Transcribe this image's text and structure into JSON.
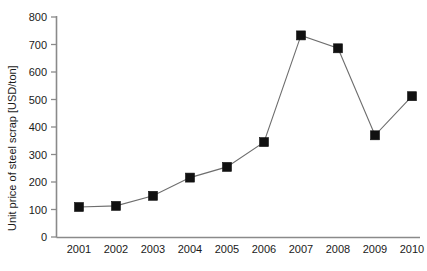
{
  "chart_data": {
    "type": "line",
    "title": "",
    "xlabel": "",
    "ylabel": "Unit price of steel scrap [USD/ton]",
    "categories": [
      "2001",
      "2002",
      "2003",
      "2004",
      "2005",
      "2006",
      "2007",
      "2008",
      "2009",
      "2010"
    ],
    "values": [
      109,
      113,
      150,
      216,
      255,
      345,
      733,
      686,
      370,
      512
    ],
    "series": [
      {
        "name": "Unit price of steel scrap",
        "values": [
          109,
          113,
          150,
          216,
          255,
          345,
          733,
          686,
          370,
          512
        ]
      }
    ],
    "ylim": [
      0,
      800
    ],
    "ytick_labels": [
      "0",
      "100",
      "200",
      "300",
      "400",
      "500",
      "600",
      "700",
      "800"
    ],
    "ytick_values": [
      0,
      100,
      200,
      300,
      400,
      500,
      600,
      700,
      800
    ],
    "xtick_labels": [
      "2001",
      "2002",
      "2003",
      "2004",
      "2005",
      "2006",
      "2007",
      "2008",
      "2009",
      "2010"
    ],
    "grid": "off",
    "legend": "none",
    "marker": "filled-square",
    "marker_color": "#111111",
    "line_color": "#6e6e6e",
    "axis_color": "#8a8a8a",
    "annotations": []
  }
}
